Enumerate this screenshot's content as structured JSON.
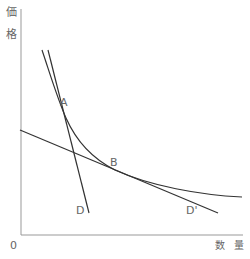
{
  "diagram": {
    "y_axis_label_1": "価",
    "y_axis_label_2": "格",
    "x_axis_label_1": "数",
    "x_axis_label_2": "量",
    "origin_label": "0",
    "point_a": "A",
    "point_b": "B",
    "line_d": "D",
    "line_d_prime": "D'",
    "colors": {
      "line": "#333333",
      "axis": "#999999",
      "text": "#666666"
    }
  }
}
